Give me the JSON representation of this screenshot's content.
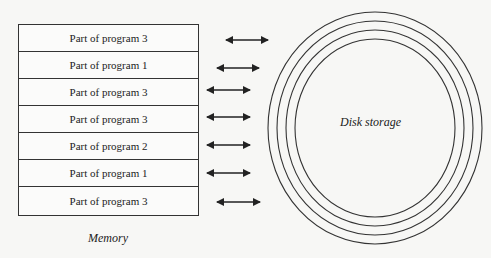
{
  "memory": {
    "label": "Memory",
    "rows": [
      {
        "label": "Part of program 3"
      },
      {
        "label": "Part of program 1"
      },
      {
        "label": "Part of program 3"
      },
      {
        "label": "Part of program 3"
      },
      {
        "label": "Part of program 2"
      },
      {
        "label": "Part of program 1"
      },
      {
        "label": "Part of program 3"
      }
    ]
  },
  "disk": {
    "label": "Disk storage",
    "rings": 4
  },
  "arrows": {
    "count": 7,
    "type": "bidirectional"
  }
}
